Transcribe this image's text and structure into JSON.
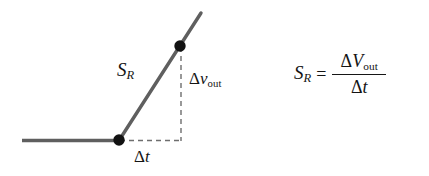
{
  "figure": {
    "background_color": "#ffffff",
    "line_color": "#5a5a5a",
    "dash_color": "#6e6e6e",
    "dot_color": "#121212",
    "text_color": "#141414"
  },
  "labels": {
    "slope": {
      "symbol": "S",
      "subscript": "R"
    },
    "rise": {
      "delta": "Δ",
      "symbol": "v",
      "subscript": "out"
    },
    "run": {
      "delta": "Δ",
      "symbol": "t"
    }
  },
  "equation": {
    "lhs_symbol": "S",
    "lhs_subscript": "R",
    "equals": "=",
    "numerator_delta": "Δ",
    "numerator_symbol": "V",
    "numerator_subscript": "out",
    "denominator_delta": "Δ",
    "denominator_symbol": "t"
  },
  "geometry": {
    "flat_line": {
      "x1": 22,
      "y1": 140,
      "x2": 119,
      "y2": 140
    },
    "sloped_line": {
      "x1": 119,
      "y1": 140,
      "x2": 201,
      "y2": 13
    },
    "dashed_vertical": {
      "x": 181,
      "y1": 46,
      "y2": 141
    },
    "dashed_horizontal": {
      "y": 140,
      "x1": 121,
      "x2": 181
    },
    "dot_lower": {
      "cx": 119,
      "cy": 140,
      "r": 5.6
    },
    "dot_upper": {
      "cx": 180,
      "cy": 46,
      "r": 5.6
    }
  }
}
